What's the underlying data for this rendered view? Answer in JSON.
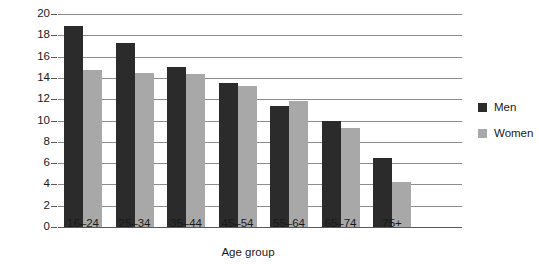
{
  "chart_data": {
    "type": "bar",
    "title": "",
    "xlabel": "Age group",
    "ylabel": "Mean number of days in past four weeks",
    "categories": [
      "16–24",
      "25–34",
      "35–44",
      "45–54",
      "55–64",
      "65–74",
      "75+"
    ],
    "series": [
      {
        "name": "Men",
        "color": "#2b2b2b",
        "values": [
          18.9,
          17.3,
          15.0,
          13.5,
          11.4,
          10.0,
          6.5
        ]
      },
      {
        "name": "Women",
        "color": "#a8a8a8",
        "values": [
          14.7,
          14.5,
          14.4,
          13.2,
          11.8,
          9.3,
          4.2
        ]
      }
    ],
    "ylim": [
      0,
      20
    ],
    "yticks": [
      "0",
      "2",
      "4",
      "6",
      "8",
      "10",
      "12",
      "14",
      "16",
      "18",
      "20"
    ],
    "ytick_values": [
      0,
      2,
      4,
      6,
      8,
      10,
      12,
      14,
      16,
      18,
      20
    ],
    "grid": true,
    "grid_axis": "y",
    "legend_position": "right",
    "legend": [
      {
        "label": "Men",
        "swatch": "men-swatch"
      },
      {
        "label": "Women",
        "swatch": "women-swatch"
      }
    ]
  }
}
